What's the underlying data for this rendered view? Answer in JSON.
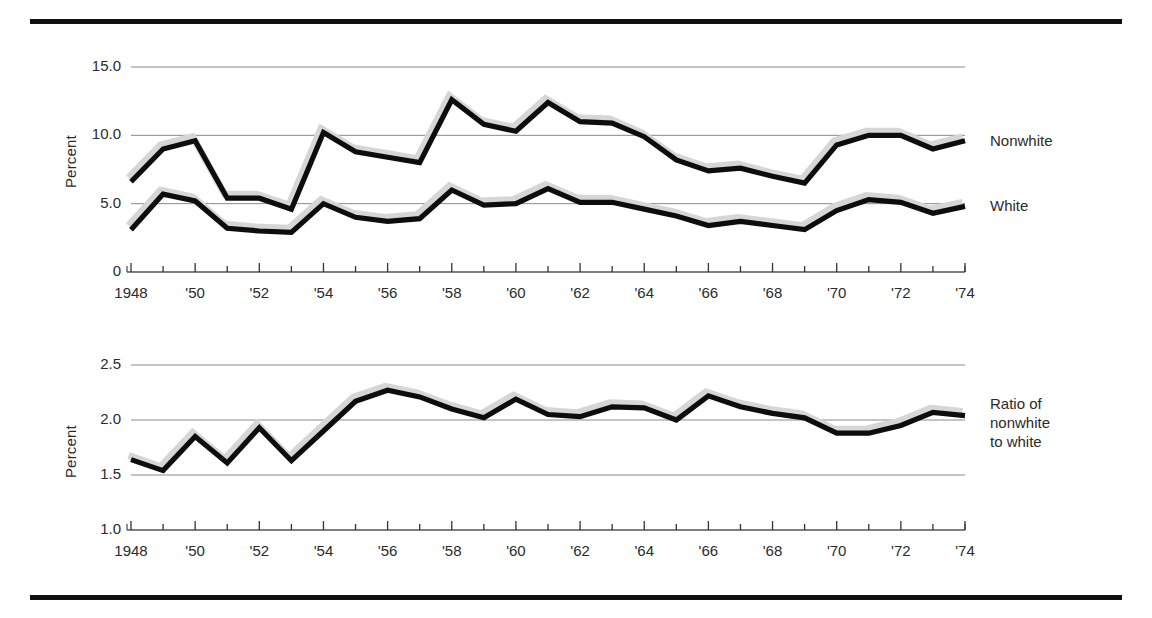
{
  "figure": {
    "top_rule": "horizontal-rule",
    "bottom_rule": "horizontal-rule"
  },
  "chart_data": [
    {
      "id": "unemployment-by-race",
      "type": "line",
      "title": "",
      "xlabel": "",
      "ylabel": "Percent",
      "xlim": [
        1948,
        1974
      ],
      "ylim": [
        0,
        15
      ],
      "yticks": [
        "0",
        "5.0",
        "10.0",
        "15.0"
      ],
      "ytick_values": [
        0,
        5.0,
        10.0,
        15.0
      ],
      "gridlines": [
        5.0,
        10.0,
        15.0
      ],
      "grid": true,
      "legend_position": "right-inline",
      "x": [
        1948,
        1949,
        1950,
        1951,
        1952,
        1953,
        1954,
        1955,
        1956,
        1957,
        1958,
        1959,
        1960,
        1961,
        1962,
        1963,
        1964,
        1965,
        1966,
        1967,
        1968,
        1969,
        1970,
        1971,
        1972,
        1973,
        1974
      ],
      "xticks": [
        "1948",
        "",
        "'50",
        "",
        "'52",
        "",
        "'54",
        "",
        "'56",
        "",
        "'58",
        "",
        "'60",
        "",
        "'62",
        "",
        "'64",
        "",
        "'66",
        "",
        "'68",
        "",
        "'70",
        "",
        "'72",
        "",
        "'74"
      ],
      "xtick_labels": [
        {
          "year": 1948,
          "label": "1948"
        },
        {
          "year": 1950,
          "label": "'50"
        },
        {
          "year": 1952,
          "label": "'52"
        },
        {
          "year": 1954,
          "label": "'54"
        },
        {
          "year": 1956,
          "label": "'56"
        },
        {
          "year": 1958,
          "label": "'58"
        },
        {
          "year": 1960,
          "label": "'60"
        },
        {
          "year": 1962,
          "label": "'62"
        },
        {
          "year": 1964,
          "label": "'64"
        },
        {
          "year": 1966,
          "label": "'66"
        },
        {
          "year": 1968,
          "label": "'68"
        },
        {
          "year": 1970,
          "label": "'70"
        },
        {
          "year": 1972,
          "label": "'72"
        },
        {
          "year": 1974,
          "label": "'74"
        }
      ],
      "series": [
        {
          "name": "Nonwhite",
          "color": "#0d0d0d",
          "values": [
            6.6,
            9.0,
            9.6,
            5.4,
            5.4,
            4.6,
            10.2,
            8.8,
            8.4,
            8.0,
            12.6,
            10.8,
            10.3,
            12.4,
            11.0,
            10.9,
            9.9,
            8.2,
            7.4,
            7.6,
            7.0,
            6.5,
            9.3,
            10.0,
            10.0,
            9.0,
            9.6
          ]
        },
        {
          "name": "White",
          "color": "#0d0d0d",
          "values": [
            3.1,
            5.7,
            5.2,
            3.2,
            3.0,
            2.9,
            5.0,
            4.0,
            3.7,
            3.9,
            6.0,
            4.9,
            5.0,
            6.1,
            5.1,
            5.1,
            4.6,
            4.1,
            3.4,
            3.7,
            3.4,
            3.1,
            4.5,
            5.3,
            5.1,
            4.3,
            4.8
          ]
        }
      ]
    },
    {
      "id": "ratio-nonwhite-to-white",
      "type": "line",
      "title": "",
      "xlabel": "",
      "ylabel": "Percent",
      "xlim": [
        1948,
        1974
      ],
      "ylim": [
        1.0,
        2.5
      ],
      "yticks": [
        "1.0",
        "1.5",
        "2.0",
        "2.5"
      ],
      "ytick_values": [
        1.0,
        1.5,
        2.0,
        2.5
      ],
      "gridlines": [
        1.5,
        2.0,
        2.5
      ],
      "grid": true,
      "legend_position": "right-inline",
      "x": [
        1948,
        1949,
        1950,
        1951,
        1952,
        1953,
        1954,
        1955,
        1956,
        1957,
        1958,
        1959,
        1960,
        1961,
        1962,
        1963,
        1964,
        1965,
        1966,
        1967,
        1968,
        1969,
        1970,
        1971,
        1972,
        1973,
        1974
      ],
      "xtick_labels": [
        {
          "year": 1948,
          "label": "1948"
        },
        {
          "year": 1950,
          "label": "'50"
        },
        {
          "year": 1952,
          "label": "'52"
        },
        {
          "year": 1954,
          "label": "'54"
        },
        {
          "year": 1956,
          "label": "'56"
        },
        {
          "year": 1958,
          "label": "'58"
        },
        {
          "year": 1960,
          "label": "'60"
        },
        {
          "year": 1962,
          "label": "'62"
        },
        {
          "year": 1964,
          "label": "'64"
        },
        {
          "year": 1966,
          "label": "'66"
        },
        {
          "year": 1968,
          "label": "'68"
        },
        {
          "year": 1970,
          "label": "'70"
        },
        {
          "year": 1972,
          "label": "'72"
        },
        {
          "year": 1974,
          "label": "'74"
        }
      ],
      "series": [
        {
          "name": "Ratio of nonwhite to white",
          "color": "#0d0d0d",
          "values": [
            1.64,
            1.54,
            1.85,
            1.61,
            1.93,
            1.63,
            1.9,
            2.17,
            2.27,
            2.21,
            2.1,
            2.02,
            2.19,
            2.05,
            2.03,
            2.12,
            2.11,
            2.0,
            2.22,
            2.12,
            2.06,
            2.02,
            1.88,
            1.88,
            1.95,
            2.07,
            2.04
          ]
        }
      ]
    }
  ],
  "legends": {
    "top": [
      {
        "name": "legend-nonwhite",
        "label": "Nonwhite"
      },
      {
        "name": "legend-white",
        "label": "White"
      }
    ],
    "bottom": [
      {
        "name": "legend-ratio",
        "line1": "Ratio of",
        "line2": "nonwhite",
        "line3": "to white"
      }
    ]
  },
  "colors": {
    "line": "#0d0d0d",
    "shadow": "#d6d6d6",
    "grid": "#8a8a8a",
    "rule": "#101010",
    "text": "#2b2b2b"
  }
}
